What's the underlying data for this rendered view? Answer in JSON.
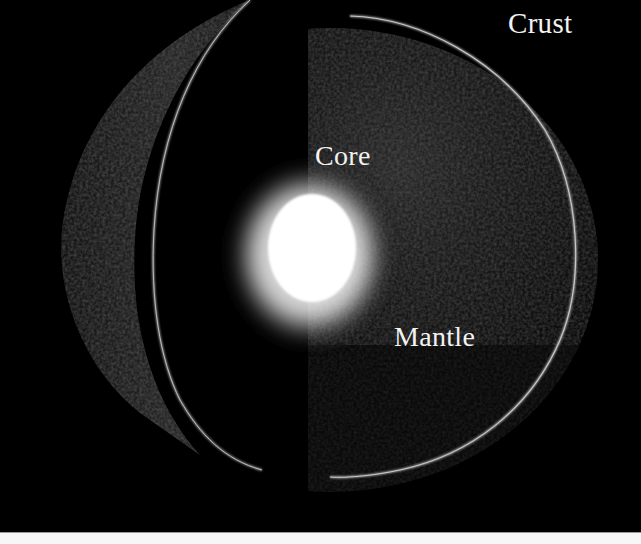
{
  "diagram": {
    "background_color": "#000000",
    "labels": {
      "crust": "Crust",
      "core": "Core",
      "mantle": "Mantle"
    },
    "layers": [
      {
        "name": "Core",
        "color": "#ffffff",
        "description": "bright glowing center"
      },
      {
        "name": "Mantle",
        "color": "#1a1a1a",
        "description": "dark textured interior"
      },
      {
        "name": "Crust",
        "color": "#9a9a9a",
        "description": "thin outer rim"
      }
    ]
  }
}
